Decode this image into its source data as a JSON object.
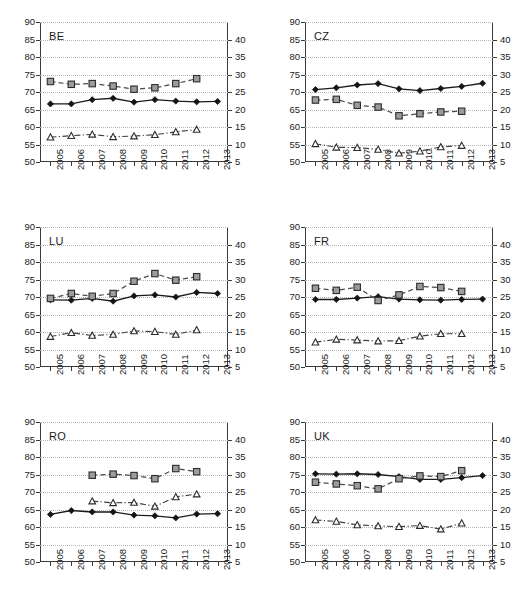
{
  "figure": {
    "layout": "2 columns x 3 rows of small-multiple line charts",
    "years": [
      "2005",
      "2006",
      "2007",
      "2008",
      "2009",
      "2010",
      "2011",
      "2012",
      "2013"
    ],
    "left_axis": {
      "ticks": [
        "90",
        "85",
        "80",
        "75",
        "70",
        "65",
        "60",
        "55",
        "50"
      ],
      "min": 50,
      "max": 90,
      "step": 5
    },
    "right_axis": {
      "ticks": [
        "40",
        "35",
        "30",
        "25",
        "20",
        "15",
        "10",
        "5"
      ],
      "min": 5,
      "max": 45,
      "step": 5
    }
  },
  "chart_data": [
    {
      "type": "line",
      "title": "BE",
      "x": [
        "2005",
        "2006",
        "2007",
        "2008",
        "2009",
        "2010",
        "2011",
        "2012",
        "2013"
      ],
      "xlabel": "",
      "ylabel": "",
      "ylim": [
        50,
        90
      ],
      "y2lim": [
        5,
        45
      ],
      "grid": true,
      "legend": "none",
      "series": [
        {
          "name": "diamond-solid-left-axis",
          "axis": "left",
          "marker": "filled-diamond",
          "line": "solid",
          "values": [
            66.6,
            66.6,
            67.8,
            68.2,
            67.1,
            67.8,
            67.4,
            67.2,
            67.3
          ]
        },
        {
          "name": "square-dashed-left-axis",
          "axis": "left",
          "marker": "gray-square",
          "line": "dashed",
          "values": [
            73.0,
            72.2,
            72.4,
            71.7,
            70.8,
            71.2,
            72.4,
            73.8,
            null
          ]
        },
        {
          "name": "triangle-dashdot-left-axis",
          "axis": "left",
          "marker": "open-triangle",
          "line": "dash-dot",
          "values": [
            57.1,
            57.5,
            57.9,
            57.2,
            57.4,
            57.8,
            58.6,
            59.3,
            null
          ]
        }
      ]
    },
    {
      "type": "line",
      "title": "CZ",
      "x": [
        "2005",
        "2006",
        "2007",
        "2008",
        "2009",
        "2010",
        "2011",
        "2012",
        "2013"
      ],
      "xlabel": "",
      "ylabel": "",
      "ylim": [
        50,
        90
      ],
      "y2lim": [
        5,
        45
      ],
      "grid": true,
      "legend": "none",
      "series": [
        {
          "name": "diamond-solid-left-axis",
          "axis": "left",
          "marker": "filled-diamond",
          "line": "solid",
          "values": [
            70.7,
            71.2,
            72.0,
            72.4,
            70.9,
            70.4,
            71.0,
            71.6,
            72.5
          ]
        },
        {
          "name": "square-dashed-left-axis",
          "axis": "left",
          "marker": "gray-square",
          "line": "dashed",
          "values": [
            67.7,
            67.9,
            66.2,
            65.7,
            63.2,
            63.8,
            64.3,
            64.5,
            null
          ]
        },
        {
          "name": "triangle-dashdot-left-axis",
          "axis": "left",
          "marker": "open-triangle",
          "line": "dash-dot",
          "values": [
            55.2,
            54.2,
            54.1,
            53.6,
            52.5,
            53.1,
            54.3,
            54.7,
            null
          ]
        }
      ]
    },
    {
      "type": "line",
      "title": "LU",
      "x": [
        "2005",
        "2006",
        "2007",
        "2008",
        "2009",
        "2010",
        "2011",
        "2012",
        "2013"
      ],
      "xlabel": "",
      "ylabel": "",
      "ylim": [
        50,
        90
      ],
      "y2lim": [
        5,
        45
      ],
      "grid": true,
      "legend": "none",
      "series": [
        {
          "name": "diamond-solid-left-axis",
          "axis": "left",
          "marker": "filled-diamond",
          "line": "solid",
          "values": [
            69.2,
            69.1,
            69.6,
            68.8,
            70.3,
            70.6,
            70.0,
            71.3,
            71.0
          ]
        },
        {
          "name": "square-dashed-left-axis",
          "axis": "left",
          "marker": "gray-square",
          "line": "dashed",
          "values": [
            69.6,
            71.0,
            70.2,
            71.0,
            74.5,
            76.7,
            74.8,
            75.8,
            null
          ]
        },
        {
          "name": "triangle-dashdot-left-axis",
          "axis": "left",
          "marker": "open-triangle",
          "line": "dash-dot",
          "values": [
            58.7,
            59.8,
            59.0,
            59.3,
            60.3,
            60.1,
            59.3,
            60.6,
            null
          ]
        }
      ]
    },
    {
      "type": "line",
      "title": "FR",
      "x": [
        "2005",
        "2006",
        "2007",
        "2008",
        "2009",
        "2010",
        "2011",
        "2012",
        "2013"
      ],
      "xlabel": "",
      "ylabel": "",
      "ylim": [
        50,
        90
      ],
      "y2lim": [
        5,
        45
      ],
      "grid": true,
      "legend": "none",
      "series": [
        {
          "name": "diamond-solid-left-axis",
          "axis": "left",
          "marker": "filled-diamond",
          "line": "solid",
          "values": [
            69.3,
            69.3,
            69.7,
            70.1,
            69.4,
            69.2,
            69.1,
            69.3,
            69.4
          ]
        },
        {
          "name": "square-dashed-left-axis",
          "axis": "left",
          "marker": "gray-square",
          "line": "dashed",
          "values": [
            72.5,
            71.9,
            72.8,
            69.0,
            70.6,
            73.0,
            72.7,
            71.6,
            null
          ]
        },
        {
          "name": "triangle-dashdot-left-axis",
          "axis": "left",
          "marker": "open-triangle",
          "line": "dash-dot",
          "values": [
            57.1,
            57.9,
            57.7,
            57.4,
            57.5,
            58.8,
            59.5,
            59.5,
            null
          ]
        }
      ]
    },
    {
      "type": "line",
      "title": "RO",
      "x": [
        "2005",
        "2006",
        "2007",
        "2008",
        "2009",
        "2010",
        "2011",
        "2012",
        "2013"
      ],
      "xlabel": "",
      "ylabel": "",
      "ylim": [
        50,
        90
      ],
      "y2lim": [
        5,
        45
      ],
      "grid": true,
      "legend": "none",
      "series": [
        {
          "name": "diamond-solid-left-axis",
          "axis": "left",
          "marker": "filled-diamond",
          "line": "solid",
          "values": [
            63.6,
            64.7,
            64.3,
            64.3,
            63.4,
            63.2,
            62.6,
            63.7,
            63.8
          ]
        },
        {
          "name": "square-dashed-left-axis",
          "axis": "left",
          "marker": "gray-square",
          "line": "dashed",
          "values": [
            null,
            null,
            74.8,
            75.1,
            74.7,
            73.8,
            76.7,
            75.8,
            null
          ]
        },
        {
          "name": "triangle-dashdot-left-axis",
          "axis": "left",
          "marker": "open-triangle",
          "line": "dash-dot",
          "values": [
            null,
            null,
            67.4,
            66.9,
            67.0,
            65.9,
            68.6,
            69.4,
            null
          ]
        }
      ]
    },
    {
      "type": "line",
      "title": "UK",
      "x": [
        "2005",
        "2006",
        "2007",
        "2008",
        "2009",
        "2010",
        "2011",
        "2012",
        "2013"
      ],
      "xlabel": "",
      "ylabel": "",
      "ylim": [
        50,
        90
      ],
      "y2lim": [
        5,
        45
      ],
      "grid": true,
      "legend": "none",
      "series": [
        {
          "name": "diamond-solid-left-axis",
          "axis": "left",
          "marker": "filled-diamond",
          "line": "solid",
          "values": [
            75.2,
            75.1,
            75.2,
            75.0,
            74.4,
            73.6,
            73.6,
            74.1,
            74.7
          ]
        },
        {
          "name": "square-dashed-left-axis",
          "axis": "left",
          "marker": "gray-square",
          "line": "dashed",
          "values": [
            72.8,
            72.3,
            71.8,
            70.9,
            73.8,
            74.6,
            74.4,
            76.1,
            null
          ]
        },
        {
          "name": "triangle-dashdot-left-axis",
          "axis": "left",
          "marker": "open-triangle",
          "line": "dash-dot",
          "values": [
            62.0,
            61.6,
            60.6,
            60.3,
            60.1,
            60.4,
            59.4,
            61.1,
            null
          ]
        }
      ]
    }
  ]
}
